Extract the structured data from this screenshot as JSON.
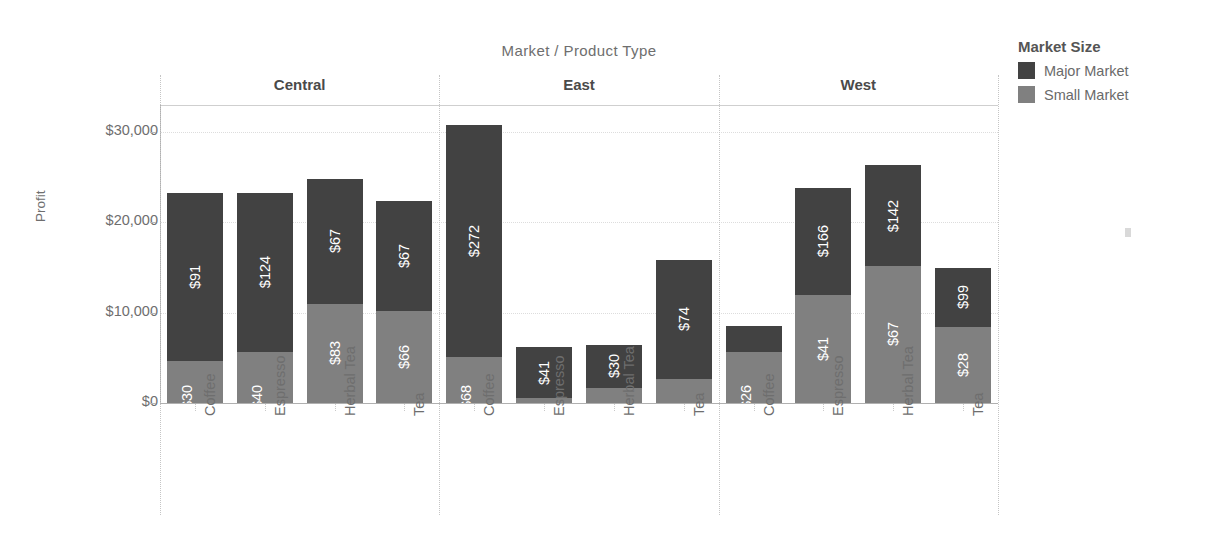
{
  "chart_title": "Market / Product Type",
  "legend": {
    "title": "Market Size",
    "items": [
      {
        "label": "Major Market",
        "color": "#424242",
        "name": "major-market"
      },
      {
        "label": "Small Market",
        "color": "#808080",
        "name": "small-market"
      }
    ]
  },
  "axes": {
    "ylabel": "Profit",
    "yticks": [
      "$0",
      "$10,000",
      "$20,000",
      "$30,000"
    ],
    "ytick_values": [
      0,
      10000,
      20000,
      30000
    ],
    "ylim": [
      0,
      31000
    ],
    "xlabel": "",
    "grid": "dotted-horizontal"
  },
  "chart_data": {
    "type": "bar",
    "subtype": "stacked-bar-small-multiples",
    "title": "Market / Product Type",
    "xlabel": "",
    "ylabel": "Profit",
    "ylim": [
      0,
      31000
    ],
    "yticks": [
      0,
      10000,
      20000,
      30000
    ],
    "ytick_labels": [
      "$0",
      "$10,000",
      "$20,000",
      "$30,000"
    ],
    "grid": true,
    "legend_position": "right",
    "stack_order": [
      "Small Market",
      "Major Market"
    ],
    "categories": [
      "Coffee",
      "Espresso",
      "Herbal Tea",
      "Tea"
    ],
    "panels": [
      {
        "name": "Central",
        "bars": [
          {
            "category": "Coffee",
            "small": {
              "label": "$30",
              "value": 4700
            },
            "major": {
              "label": "$91",
              "value": 18500
            },
            "total": 23200
          },
          {
            "category": "Espresso",
            "small": {
              "label": "$40",
              "value": 5600
            },
            "major": {
              "label": "$124",
              "value": 17700
            },
            "total": 23300
          },
          {
            "category": "Herbal Tea",
            "small": {
              "label": "$83",
              "value": 11000
            },
            "major": {
              "label": "$67",
              "value": 13800
            },
            "total": 24800
          },
          {
            "category": "Tea",
            "small": {
              "label": "$66",
              "value": 10200
            },
            "major": {
              "label": "$67",
              "value": 12200
            },
            "total": 22400
          }
        ]
      },
      {
        "name": "East",
        "bars": [
          {
            "category": "Coffee",
            "small": {
              "label": "$68",
              "value": 5100
            },
            "major": {
              "label": "$272",
              "value": 25700
            },
            "total": 30800
          },
          {
            "category": "Espresso",
            "small": {
              "label": "",
              "value": 500
            },
            "major": {
              "label": "$41",
              "value": 5700
            },
            "total": 6200
          },
          {
            "category": "Herbal Tea",
            "small": {
              "label": "",
              "value": 1700
            },
            "major": {
              "label": "$30",
              "value": 4700
            },
            "total": 6400
          },
          {
            "category": "Tea",
            "small": {
              "label": "",
              "value": 2700
            },
            "major": {
              "label": "$74",
              "value": 13100
            },
            "total": 15800
          }
        ]
      },
      {
        "name": "West",
        "bars": [
          {
            "category": "Coffee",
            "small": {
              "label": "$26",
              "value": 5600
            },
            "major": {
              "label": "",
              "value": 2900
            },
            "total": 8500
          },
          {
            "category": "Espresso",
            "small": {
              "label": "$41",
              "value": 12000
            },
            "major": {
              "label": "$166",
              "value": 11800
            },
            "total": 23800
          },
          {
            "category": "Herbal Tea",
            "small": {
              "label": "$67",
              "value": 15200
            },
            "major": {
              "label": "$142",
              "value": 11100
            },
            "total": 26300
          },
          {
            "category": "Tea",
            "small": {
              "label": "$28",
              "value": 8400
            },
            "major": {
              "label": "$99",
              "value": 6600
            },
            "total": 15000
          }
        ]
      }
    ]
  }
}
